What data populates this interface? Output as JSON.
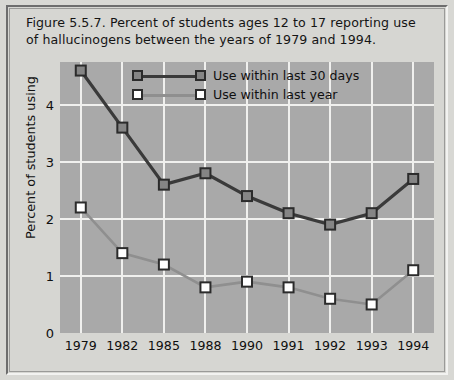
{
  "figure": {
    "caption": "Figure 5.5.7. Percent of students ages 12 to 17 reporting use of hallucinogens between the years of 1979 and 1994."
  },
  "colors": {
    "figure_background": "#d6d6d2",
    "plot_background": "#a9a9a9",
    "gridline": "#f0f0ee",
    "series_30days_line": "#3a3a3a",
    "series_30days_marker_fill": "#858585",
    "series_year_line": "#8f8f8f",
    "series_year_marker_fill": "#ffffff",
    "marker_edge": "#2b2b2b",
    "text": "#111111"
  },
  "chart_data": {
    "type": "line",
    "title": "Figure 5.5.7. Percent of students ages 12 to 17 reporting use of hallucinogens between the years of 1979 and 1994.",
    "xlabel": "",
    "ylabel": "Percent of students using",
    "categories": [
      "1979",
      "1982",
      "1985",
      "1988",
      "1990",
      "1991",
      "1992",
      "1993",
      "1994"
    ],
    "ylim": [
      0,
      4.75
    ],
    "yticks": [
      0,
      1,
      2,
      3,
      4
    ],
    "ytick_labels": [
      "0",
      "1",
      "2",
      "3",
      "4"
    ],
    "grid": true,
    "legend_position": "top-center",
    "series": [
      {
        "name": "Use within last 30 days",
        "values": [
          4.6,
          3.6,
          2.6,
          2.8,
          2.4,
          2.1,
          1.9,
          2.1,
          2.7
        ]
      },
      {
        "name": "Use within last year",
        "values": [
          2.2,
          1.4,
          1.2,
          0.8,
          0.9,
          0.8,
          0.6,
          0.5,
          1.1
        ]
      }
    ]
  }
}
